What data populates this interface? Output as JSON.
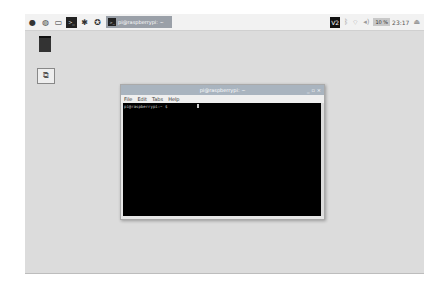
{
  "panel": {
    "launchers": [
      {
        "name": "raspberry-menu-icon",
        "glyph": "●"
      },
      {
        "name": "browser-icon",
        "glyph": "◍"
      },
      {
        "name": "file-manager-icon",
        "glyph": "▭"
      },
      {
        "name": "terminal-icon",
        "glyph": ">_"
      },
      {
        "name": "mathematica-icon",
        "glyph": "✱"
      },
      {
        "name": "wolfram-icon",
        "glyph": "✪"
      }
    ],
    "task": {
      "label": "pi@raspberrypi: ~",
      "icon": ">_"
    },
    "tray": {
      "vnc": "V2",
      "bluetooth": "ᛒ",
      "wifi": "⌔",
      "volume": "◂)",
      "keyboard": "10 %",
      "clock": "23:17",
      "eject": "⏏"
    }
  },
  "desktop": {
    "trash_label": "",
    "icon_glyph": "⧉"
  },
  "terminal": {
    "title": "pi@raspberrypi: ~",
    "controls": [
      "_",
      "▫",
      "×"
    ],
    "menu": [
      "File",
      "Edit",
      "Tabs",
      "Help"
    ],
    "prompt": "pi@raspberrypi:~ $"
  }
}
